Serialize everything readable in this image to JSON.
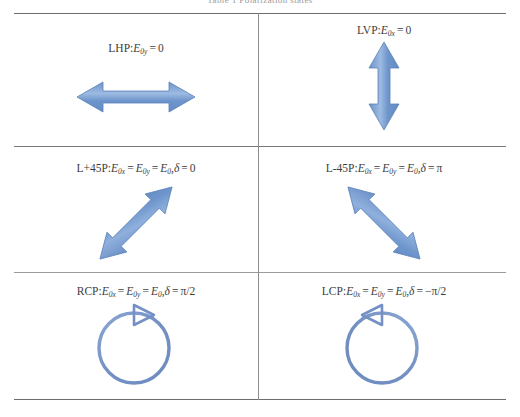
{
  "caption": "Table 1   Polarization states",
  "colors": {
    "arrow_fill": "#6f96cc",
    "arrow_fill_light": "#9dbbe2",
    "arrow_stroke": "#5b82b8",
    "circle_stroke": "#7490c4",
    "rule": "#6d6d6d",
    "divider": "#8d8d8d",
    "text": "#3d3d3d"
  },
  "table": {
    "rows": [
      {
        "cells": [
          {
            "id": "lhp",
            "name": "LHP",
            "prefix": "LHP",
            "colon": ":",
            "terms": [
              {
                "sym": "E",
                "sub": "0y"
              }
            ],
            "equals": "=",
            "value": "0",
            "label_text": "LHP: E0y = 0",
            "glyph": "double-arrow-horizontal",
            "glyph_name": "horizontal-double-arrow"
          },
          {
            "id": "lvp",
            "name": "LVP",
            "prefix": "LVP",
            "colon": ":",
            "terms": [
              {
                "sym": "E",
                "sub": "0x"
              }
            ],
            "equals": "=",
            "value": "0",
            "label_text": "LVP: E0x = 0",
            "glyph": "double-arrow-vertical",
            "glyph_name": "vertical-double-arrow"
          }
        ]
      },
      {
        "cells": [
          {
            "id": "l45p",
            "name": "L+45P",
            "prefix": "L+45P",
            "colon": ":",
            "chain": "E0x = E0y = E0",
            "delta_label": "δ",
            "delta_value": "0",
            "label_text": "L+45P: E0x = E0y = E0, δ = 0",
            "glyph": "double-arrow-diag-up",
            "glyph_name": "diagonal-double-arrow-plus45"
          },
          {
            "id": "lm45p",
            "name": "L-45P",
            "prefix": "L-45P",
            "colon": ":",
            "chain": "E0x = E0y = E0",
            "delta_label": "δ",
            "delta_value": "π",
            "label_text": "L-45P: E0x = E0y = E0, δ = π",
            "glyph": "double-arrow-diag-down",
            "glyph_name": "diagonal-double-arrow-minus45"
          }
        ]
      },
      {
        "cells": [
          {
            "id": "rcp",
            "name": "RCP",
            "prefix": "RCP",
            "colon": ":",
            "chain": "E0x = E0y = E0",
            "delta_label": "δ",
            "delta_value": "π/2",
            "label_text": "RCP: E0x = E0y = E0, δ = π/2",
            "glyph": "circle-arrow-clockwise",
            "glyph_name": "clockwise-circle-arrow"
          },
          {
            "id": "lcp",
            "name": "LCP",
            "prefix": "LCP",
            "colon": ":",
            "chain": "E0x = E0y = E0",
            "delta_label": "δ",
            "delta_value": "−π/2",
            "label_text": "LCP: E0x = E0y = E0, δ = −π/2",
            "glyph": "circle-arrow-counterclockwise",
            "glyph_name": "counterclockwise-circle-arrow"
          }
        ]
      }
    ]
  },
  "symbols": {
    "E": "E",
    "equals": "=",
    "comma": ",",
    "zero_sub_x": "0x",
    "zero_sub_y": "0y",
    "zero_sub": "0"
  }
}
